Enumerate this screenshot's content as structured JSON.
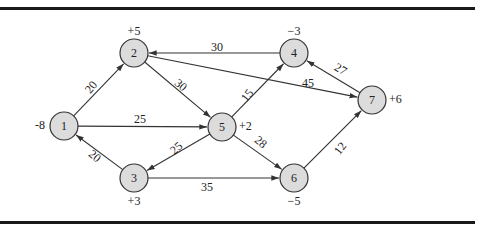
{
  "figure": {
    "type": "directed-network",
    "colors": {
      "node_fill": "#dcdcdc",
      "node_stroke": "#333333",
      "edge": "#333333",
      "text": "#222222",
      "rule": "#1a1a1a"
    },
    "nodes": [
      {
        "id": "1",
        "label": "1",
        "x": 64,
        "y": 126,
        "supply": "-8",
        "supply_pos": "left"
      },
      {
        "id": "2",
        "label": "2",
        "x": 134,
        "y": 53,
        "supply": "+5",
        "supply_pos": "top"
      },
      {
        "id": "3",
        "label": "3",
        "x": 134,
        "y": 178,
        "supply": "+3",
        "supply_pos": "bottom"
      },
      {
        "id": "4",
        "label": "4",
        "x": 294,
        "y": 53,
        "supply": "−3",
        "supply_pos": "top"
      },
      {
        "id": "5",
        "label": "5",
        "x": 222,
        "y": 127,
        "supply": "+2",
        "supply_pos": "right"
      },
      {
        "id": "6",
        "label": "6",
        "x": 294,
        "y": 178,
        "supply": "−5",
        "supply_pos": "bottom"
      },
      {
        "id": "7",
        "label": "7",
        "x": 372,
        "y": 100,
        "supply": "+6",
        "supply_pos": "right"
      }
    ],
    "edges": [
      {
        "from": "1",
        "to": "2",
        "weight": "20"
      },
      {
        "from": "1",
        "to": "5",
        "weight": "25"
      },
      {
        "from": "2",
        "to": "5",
        "weight": "30"
      },
      {
        "from": "2",
        "to": "7",
        "weight": "45"
      },
      {
        "from": "3",
        "to": "1",
        "weight": "20"
      },
      {
        "from": "3",
        "to": "6",
        "weight": "35"
      },
      {
        "from": "4",
        "to": "2",
        "weight": "30"
      },
      {
        "from": "5",
        "to": "3",
        "weight": "25"
      },
      {
        "from": "5",
        "to": "4",
        "weight": "15"
      },
      {
        "from": "5",
        "to": "6",
        "weight": "28"
      },
      {
        "from": "6",
        "to": "7",
        "weight": "12"
      },
      {
        "from": "7",
        "to": "4",
        "weight": "27"
      }
    ],
    "edge_label_positions": {
      "1-2": {
        "x": 92,
        "y": 88,
        "rotate": -50
      },
      "1-5": {
        "x": 140,
        "y": 120,
        "rotate": 0
      },
      "2-5": {
        "x": 180,
        "y": 86,
        "rotate": 40
      },
      "2-7": {
        "x": 308,
        "y": 84,
        "rotate": 0
      },
      "3-1": {
        "x": 94,
        "y": 157,
        "rotate": 40
      },
      "3-6": {
        "x": 207,
        "y": 188,
        "rotate": 0
      },
      "4-2": {
        "x": 217,
        "y": 48,
        "rotate": 0
      },
      "5-3": {
        "x": 177,
        "y": 149,
        "rotate": -40
      },
      "5-4": {
        "x": 248,
        "y": 96,
        "rotate": -52
      },
      "5-6": {
        "x": 260,
        "y": 143,
        "rotate": 40
      },
      "6-7": {
        "x": 341,
        "y": 149,
        "rotate": -52
      },
      "7-4": {
        "x": 340,
        "y": 70,
        "rotate": 30
      }
    }
  }
}
